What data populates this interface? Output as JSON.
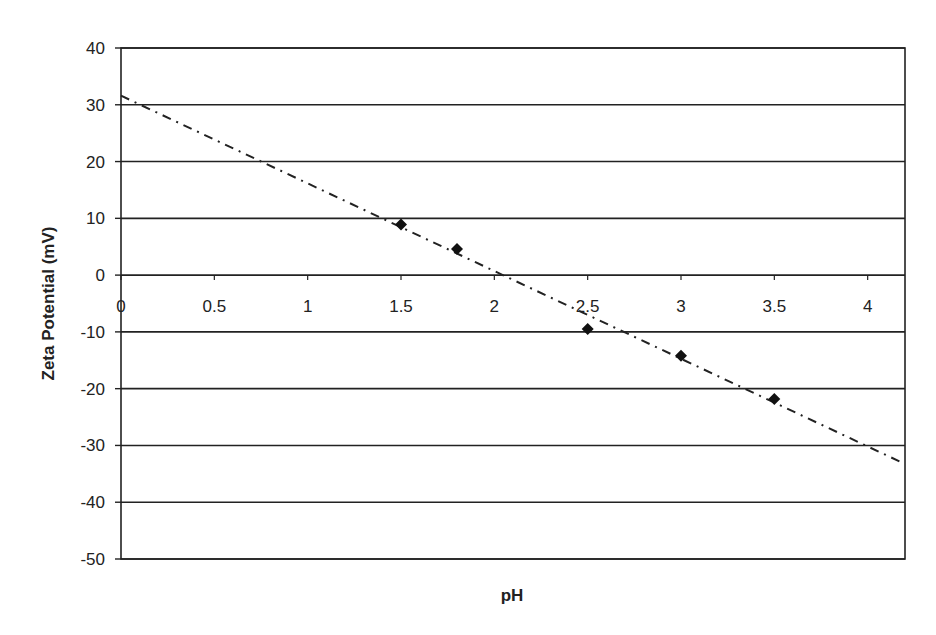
{
  "chart_data": {
    "type": "scatter",
    "title": "",
    "xlabel": "pH",
    "ylabel": "Zeta Potential (mV)",
    "xlim": [
      0,
      4.2
    ],
    "ylim": [
      -50,
      40
    ],
    "x_ticks": [
      0,
      0.5,
      1,
      1.5,
      2,
      2.5,
      3,
      3.5,
      4
    ],
    "x_tick_labels": [
      "0",
      "0.5",
      "1",
      "1.5",
      "2",
      "2.5",
      "3",
      "3.5",
      "4"
    ],
    "y_ticks": [
      40,
      30,
      20,
      10,
      0,
      -10,
      -20,
      -30,
      -40,
      -50
    ],
    "y_tick_labels": [
      "40",
      "30",
      "20",
      "10",
      "0",
      "-10",
      "-20",
      "-30",
      "-40",
      "-50"
    ],
    "grid": {
      "horizontal": true,
      "vertical": false
    },
    "legend": null,
    "series": [
      {
        "name": "Measured",
        "marker": "diamond",
        "color": "#111111",
        "x": [
          1.5,
          1.8,
          2.5,
          3.0,
          3.5
        ],
        "y": [
          8.9,
          4.6,
          -9.5,
          -14.2,
          -21.8
        ]
      }
    ],
    "trendline": {
      "type": "linear",
      "style": "dash-dot",
      "color": "#222222",
      "x": [
        0,
        4.17
      ],
      "y": [
        31.6,
        -32.8
      ]
    }
  },
  "labels": {
    "x_axis_title": "pH",
    "y_axis_title": "Zeta Potential (mV)"
  }
}
